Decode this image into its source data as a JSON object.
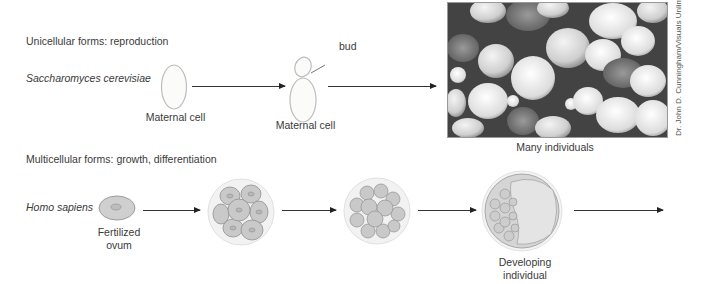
{
  "unicellular": {
    "heading": "Unicellular forms: reproduction",
    "organism": "Saccharomyces cerevisiae",
    "stages": [
      {
        "label": "Maternal cell"
      },
      {
        "label": "Maternal cell",
        "annotation": "bud"
      },
      {
        "label": "Many individuals"
      }
    ],
    "photo_credit": "Dr. John D. Cunningham/Visuals Unlimited"
  },
  "multicellular": {
    "heading": "Multicellular forms: growth, differentiation",
    "organism": "Homo sapiens",
    "stages": [
      {
        "label_line1": "Fertilized",
        "label_line2": "ovum"
      },
      {
        "label": ""
      },
      {
        "label": ""
      },
      {
        "label_line1": "Developing",
        "label_line2": "individual"
      }
    ]
  }
}
